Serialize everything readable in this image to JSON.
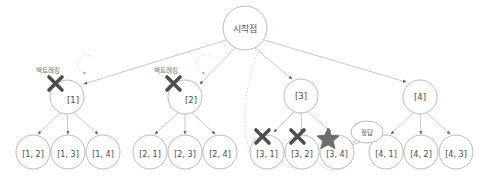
{
  "diagram": {
    "title_text": "시작점",
    "type": "tree",
    "background_color": "#ffffff",
    "edge_color": "#b9b9b9",
    "node_stroke_color": "#b0b0b0",
    "node_fill_color": "#ffffff",
    "mark_color": "#4d4d4d",
    "backtrack_dash_color": "#c9c9c9",
    "text_color": "#4a4a4a",
    "root": {
      "label": "시작점",
      "cx": 245,
      "cy": 28,
      "r": 22
    },
    "level1": [
      {
        "label": "[1]",
        "cx": 67,
        "cy": 97,
        "r": 17,
        "mark": "x",
        "mark_name": "cross-mark",
        "backtrack": true,
        "backtrack_label": "백트래킹"
      },
      {
        "label": "[2]",
        "cx": 185,
        "cy": 97,
        "r": 17,
        "mark": "x",
        "mark_name": "cross-mark",
        "backtrack": true,
        "backtrack_label": "백트래킹"
      },
      {
        "label": "[3]",
        "cx": 301,
        "cy": 96,
        "r": 17,
        "mark": "none",
        "mark_name": "",
        "backtrack": false,
        "backtrack_label": ""
      },
      {
        "label": "[4]",
        "cx": 420,
        "cy": 97,
        "r": 17,
        "mark": "none",
        "mark_name": "",
        "backtrack": false,
        "backtrack_label": ""
      }
    ],
    "leaves": [
      {
        "label": "[1, 2]",
        "cx": 33,
        "cy": 152,
        "r": 17,
        "parent": 0,
        "mark": "none"
      },
      {
        "label": "[1, 3]",
        "cx": 68,
        "cy": 152,
        "r": 17,
        "parent": 0,
        "mark": "none"
      },
      {
        "label": "[1, 4]",
        "cx": 103,
        "cy": 152,
        "r": 17,
        "parent": 0,
        "mark": "none"
      },
      {
        "label": "[2, 1]",
        "cx": 150,
        "cy": 152,
        "r": 17,
        "parent": 1,
        "mark": "none"
      },
      {
        "label": "[2, 3]",
        "cx": 185,
        "cy": 152,
        "r": 17,
        "parent": 1,
        "mark": "none"
      },
      {
        "label": "[2, 4]",
        "cx": 220,
        "cy": 152,
        "r": 17,
        "parent": 1,
        "mark": "none"
      },
      {
        "label": "[3, 1]",
        "cx": 267,
        "cy": 152,
        "r": 17,
        "parent": 2,
        "mark": "x"
      },
      {
        "label": "[3, 2]",
        "cx": 302,
        "cy": 152,
        "r": 17,
        "parent": 2,
        "mark": "x"
      },
      {
        "label": "[3, 4]",
        "cx": 337,
        "cy": 152,
        "r": 17,
        "parent": 2,
        "mark": "star"
      },
      {
        "label": "[4, 1]",
        "cx": 386,
        "cy": 152,
        "r": 17,
        "parent": 3,
        "mark": "none"
      },
      {
        "label": "[4, 2]",
        "cx": 421,
        "cy": 152,
        "r": 17,
        "parent": 3,
        "mark": "none"
      },
      {
        "label": "[4, 3]",
        "cx": 456,
        "cy": 152,
        "r": 17,
        "parent": 3,
        "mark": "none"
      }
    ],
    "answer_callout": {
      "label": "정답",
      "cx": 367,
      "cy": 132,
      "rx": 16,
      "ry": 11,
      "points_to": "[3, 4]"
    },
    "annotations": {
      "backtrack_term": "백트래킹",
      "answer_term": "정답"
    }
  }
}
